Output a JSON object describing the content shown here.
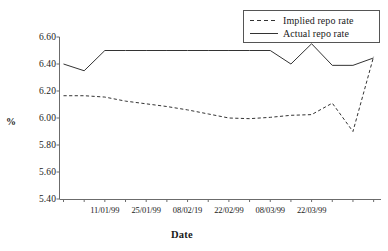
{
  "chart_data": {
    "type": "line",
    "title": "",
    "xlabel": "Date",
    "ylabel": "%",
    "ylim": [
      5.4,
      6.6
    ],
    "ytick_labels": [
      "6.60",
      "6.40",
      "6.20",
      "6.00",
      "5.80",
      "5.60",
      "5.40"
    ],
    "ytick_values": [
      6.6,
      6.4,
      6.2,
      6.0,
      5.8,
      5.6,
      5.4
    ],
    "xtick_labels": [
      "11/01/99",
      "25/01/99",
      "08/02/19",
      "22/02/99",
      "08/03/99",
      "22/03/99"
    ],
    "xtick_indices": [
      2,
      4,
      6,
      8,
      10,
      12
    ],
    "grid": false,
    "legend_position": "top-right",
    "x_count": 15,
    "series": [
      {
        "name": "Implied repo rate",
        "style": "dashed",
        "color": "#333333",
        "values": [
          6.165,
          6.165,
          6.155,
          6.125,
          6.105,
          6.085,
          6.06,
          6.03,
          6.0,
          5.995,
          6.005,
          6.02,
          6.025,
          6.11,
          5.9,
          6.455
        ]
      },
      {
        "name": "Actual repo rate",
        "style": "solid",
        "color": "#333333",
        "values": [
          6.4,
          6.35,
          6.5,
          6.5,
          6.5,
          6.5,
          6.5,
          6.5,
          6.5,
          6.5,
          6.5,
          6.4,
          6.55,
          6.39,
          6.39,
          6.445
        ]
      }
    ]
  },
  "legend": {
    "items": [
      {
        "label": "Implied repo rate",
        "style": "dashed"
      },
      {
        "label": "Actual repo rate",
        "style": "solid"
      }
    ]
  }
}
